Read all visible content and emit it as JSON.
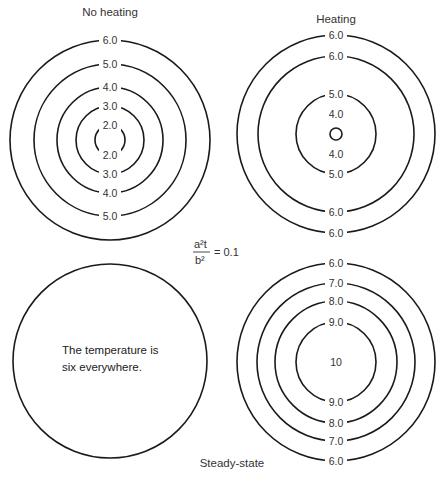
{
  "panels": {
    "no_heating": {
      "title": "No heating",
      "center": [
        110,
        140
      ],
      "rings": [
        {
          "radius": 100,
          "label_top": "6.0",
          "label_bottom": ""
        },
        {
          "radius": 76,
          "label_top": "5.0",
          "label_bottom": "5.0"
        },
        {
          "radius": 53,
          "label_top": "4.0",
          "label_bottom": "4.0"
        },
        {
          "radius": 34,
          "label_top": "3.0",
          "label_bottom": "3.0"
        },
        {
          "radius": 15,
          "label_top": "2.0",
          "label_bottom": "2.0"
        }
      ]
    },
    "heating": {
      "title": "Heating",
      "center": [
        336,
        134
      ],
      "rings": [
        {
          "radius": 99,
          "label_top": "6.0",
          "label_bottom": "6.0"
        },
        {
          "radius": 78,
          "label_top": "6.0",
          "label_bottom": "6.0"
        },
        {
          "radius": 40,
          "label_top": "5.0",
          "label_bottom": "5.0"
        },
        {
          "radius": 6,
          "label_top": "4.0",
          "label_bottom": "4.0"
        }
      ]
    },
    "uniform": {
      "center": [
        110,
        361
      ],
      "radius": 97,
      "note_line1": "The temperature is",
      "note_line2": "six everywhere."
    },
    "steady_state": {
      "title": "Steady-state",
      "center": [
        336,
        362
      ],
      "center_label": "10",
      "rings": [
        {
          "radius": 99,
          "label_top": "6.0",
          "label_bottom": "6.0"
        },
        {
          "radius": 79,
          "label_top": "7.0",
          "label_bottom": "7.0"
        },
        {
          "radius": 61,
          "label_top": "8.0",
          "label_bottom": "8.0"
        },
        {
          "radius": 40,
          "label_top": "9.0",
          "label_bottom": "9.0"
        }
      ]
    }
  },
  "equation": {
    "numerator": "a²t",
    "denominator": "b²",
    "rhs": "= 0.1"
  }
}
